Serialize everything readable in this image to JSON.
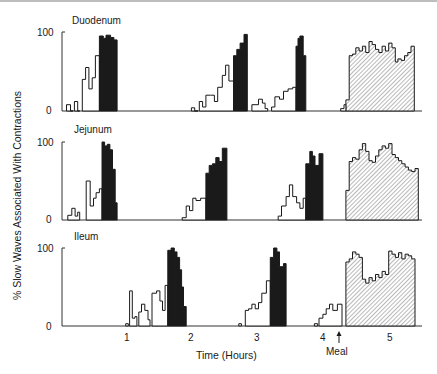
{
  "chart_data": {
    "type": "bar",
    "subtype": "stepped-histogram, three stacked panels",
    "title": "",
    "ylabel": "% Slow Waves Associated With Contractions",
    "xlabel": "Time (Hours)",
    "x_ticks": [
      1,
      2,
      3,
      4,
      5
    ],
    "y_ticks": [
      0,
      100
    ],
    "ylim": [
      0,
      100
    ],
    "xlim": [
      -0.1,
      5.5
    ],
    "annotations": [
      {
        "text": "Meal",
        "x": 4.3,
        "arrow": "up"
      }
    ],
    "legend": [
      {
        "style": "open",
        "meaning": "phase II (irregular) activity"
      },
      {
        "style": "solid-black",
        "meaning": "phase III (activity front)"
      },
      {
        "style": "hatched",
        "meaning": "fed pattern after meal"
      }
    ],
    "grid": false,
    "panels": [
      {
        "name": "Duodenum",
        "open": [
          [
            0.08,
            0.14,
            8
          ],
          [
            0.14,
            0.18,
            0
          ],
          [
            0.2,
            0.25,
            12
          ],
          [
            0.25,
            0.28,
            0
          ],
          [
            0.32,
            0.37,
            40
          ],
          [
            0.37,
            0.42,
            55
          ],
          [
            0.42,
            0.47,
            28
          ],
          [
            0.47,
            0.52,
            42
          ],
          [
            0.52,
            0.58,
            70
          ],
          [
            1.98,
            2.03,
            4
          ],
          [
            2.03,
            2.08,
            0
          ],
          [
            2.1,
            2.15,
            12
          ],
          [
            2.15,
            2.2,
            5
          ],
          [
            2.2,
            2.27,
            20
          ],
          [
            2.27,
            2.33,
            20
          ],
          [
            2.33,
            2.38,
            12
          ],
          [
            2.38,
            2.45,
            30
          ],
          [
            2.45,
            2.5,
            45
          ],
          [
            2.5,
            2.55,
            58
          ],
          [
            2.55,
            2.62,
            38
          ],
          [
            2.9,
            3.0,
            8
          ],
          [
            3.0,
            3.06,
            15
          ],
          [
            3.06,
            3.1,
            10
          ],
          [
            3.1,
            3.14,
            3
          ],
          [
            3.2,
            3.25,
            5
          ],
          [
            3.25,
            3.32,
            18
          ],
          [
            3.32,
            3.38,
            15
          ],
          [
            3.38,
            3.45,
            25
          ],
          [
            3.45,
            3.52,
            28
          ],
          [
            3.52,
            3.57,
            30
          ],
          [
            4.25,
            4.3,
            3
          ],
          [
            4.3,
            4.33,
            8
          ]
        ],
        "phase3": [
          [
            0.58,
            0.64,
            95
          ],
          [
            0.64,
            0.68,
            92
          ],
          [
            0.68,
            0.75,
            96
          ],
          [
            0.75,
            0.8,
            93
          ],
          [
            0.8,
            0.85,
            90
          ],
          [
            2.62,
            2.67,
            70
          ],
          [
            2.67,
            2.72,
            78
          ],
          [
            2.72,
            2.78,
            86
          ],
          [
            2.78,
            2.83,
            97
          ],
          [
            3.57,
            3.6,
            82
          ],
          [
            3.6,
            3.63,
            92
          ],
          [
            3.63,
            3.68,
            95
          ],
          [
            3.68,
            3.72,
            70
          ]
        ],
        "fed": [
          [
            4.33,
            4.38,
            14
          ],
          [
            4.38,
            4.43,
            70
          ],
          [
            4.43,
            4.48,
            72
          ],
          [
            4.48,
            4.53,
            80
          ],
          [
            4.53,
            4.58,
            76
          ],
          [
            4.58,
            4.63,
            82
          ],
          [
            4.63,
            4.68,
            74
          ],
          [
            4.68,
            4.73,
            88
          ],
          [
            4.73,
            4.78,
            84
          ],
          [
            4.78,
            4.83,
            78
          ],
          [
            4.83,
            4.88,
            74
          ],
          [
            4.88,
            4.93,
            82
          ],
          [
            4.93,
            4.98,
            76
          ],
          [
            4.98,
            5.03,
            86
          ],
          [
            5.03,
            5.08,
            80
          ],
          [
            5.08,
            5.12,
            62
          ],
          [
            5.12,
            5.17,
            66
          ],
          [
            5.17,
            5.22,
            64
          ],
          [
            5.22,
            5.27,
            70
          ],
          [
            5.27,
            5.32,
            74
          ],
          [
            5.32,
            5.37,
            82
          ]
        ]
      },
      {
        "name": "Jejunum",
        "open": [
          [
            0.1,
            0.16,
            6
          ],
          [
            0.16,
            0.21,
            15
          ],
          [
            0.21,
            0.25,
            5
          ],
          [
            0.25,
            0.28,
            10
          ],
          [
            0.38,
            0.44,
            50
          ],
          [
            0.44,
            0.49,
            18
          ],
          [
            0.49,
            0.53,
            28
          ],
          [
            0.53,
            0.58,
            35
          ],
          [
            0.58,
            0.62,
            40
          ],
          [
            1.84,
            1.9,
            3
          ],
          [
            1.9,
            1.95,
            18
          ],
          [
            1.95,
            2.0,
            12
          ],
          [
            2.0,
            2.05,
            28
          ],
          [
            2.05,
            2.12,
            25
          ],
          [
            2.12,
            2.2,
            28
          ],
          [
            3.3,
            3.35,
            5
          ],
          [
            3.35,
            3.42,
            18
          ],
          [
            3.42,
            3.47,
            30
          ],
          [
            3.47,
            3.52,
            45
          ],
          [
            3.52,
            3.58,
            30
          ],
          [
            3.58,
            3.63,
            22
          ],
          [
            3.63,
            3.68,
            15
          ],
          [
            3.68,
            3.72,
            28
          ]
        ],
        "phase3": [
          [
            0.62,
            0.66,
            100
          ],
          [
            0.66,
            0.7,
            95
          ],
          [
            0.7,
            0.74,
            97
          ],
          [
            0.74,
            0.78,
            90
          ],
          [
            0.78,
            0.82,
            65
          ],
          [
            0.82,
            0.85,
            22
          ],
          [
            2.2,
            2.25,
            60
          ],
          [
            2.25,
            2.3,
            70
          ],
          [
            2.3,
            2.35,
            72
          ],
          [
            2.35,
            2.4,
            80
          ],
          [
            2.4,
            2.45,
            75
          ],
          [
            2.45,
            2.52,
            92
          ],
          [
            3.72,
            3.78,
            72
          ],
          [
            3.78,
            3.82,
            88
          ],
          [
            3.82,
            3.86,
            82
          ],
          [
            3.86,
            3.92,
            70
          ],
          [
            3.92,
            3.98,
            85
          ]
        ],
        "fed": [
          [
            4.33,
            4.38,
            38
          ],
          [
            4.38,
            4.43,
            75
          ],
          [
            4.43,
            4.48,
            80
          ],
          [
            4.48,
            4.53,
            78
          ],
          [
            4.53,
            4.58,
            90
          ],
          [
            4.58,
            4.63,
            98
          ],
          [
            4.63,
            4.68,
            88
          ],
          [
            4.68,
            4.73,
            76
          ],
          [
            4.73,
            4.78,
            74
          ],
          [
            4.78,
            4.83,
            82
          ],
          [
            4.83,
            4.88,
            90
          ],
          [
            4.88,
            4.93,
            95
          ],
          [
            4.93,
            4.98,
            92
          ],
          [
            4.98,
            5.03,
            98
          ],
          [
            5.03,
            5.08,
            84
          ],
          [
            5.08,
            5.13,
            80
          ],
          [
            5.13,
            5.18,
            76
          ],
          [
            5.18,
            5.23,
            72
          ],
          [
            5.23,
            5.28,
            68
          ],
          [
            5.28,
            5.33,
            64
          ],
          [
            5.33,
            5.38,
            62
          ],
          [
            5.38,
            5.43,
            66
          ]
        ]
      },
      {
        "name": "Ileum",
        "open": [
          [
            0.98,
            1.02,
            3
          ],
          [
            1.04,
            1.08,
            45
          ],
          [
            1.08,
            1.12,
            10
          ],
          [
            1.12,
            1.15,
            12
          ],
          [
            1.18,
            1.22,
            18
          ],
          [
            1.22,
            1.27,
            28
          ],
          [
            1.27,
            1.32,
            20
          ],
          [
            1.32,
            1.35,
            8
          ],
          [
            1.38,
            1.45,
            42
          ],
          [
            1.45,
            1.5,
            45
          ],
          [
            1.5,
            1.54,
            32
          ],
          [
            1.54,
            1.58,
            20
          ],
          [
            1.58,
            1.62,
            52
          ],
          [
            2.7,
            2.74,
            3
          ],
          [
            2.8,
            2.85,
            20
          ],
          [
            2.85,
            2.9,
            22
          ],
          [
            2.9,
            2.95,
            28
          ],
          [
            2.95,
            3.0,
            22
          ],
          [
            3.0,
            3.05,
            30
          ],
          [
            3.05,
            3.12,
            42
          ],
          [
            3.12,
            3.18,
            58
          ],
          [
            3.85,
            3.9,
            3
          ],
          [
            3.92,
            3.98,
            10
          ],
          [
            3.98,
            4.03,
            15
          ],
          [
            4.03,
            4.08,
            22
          ],
          [
            4.08,
            4.13,
            28
          ],
          [
            4.13,
            4.2,
            20
          ],
          [
            4.2,
            4.27,
            28
          ]
        ],
        "phase3": [
          [
            1.62,
            1.67,
            97
          ],
          [
            1.67,
            1.72,
            100
          ],
          [
            1.72,
            1.76,
            95
          ],
          [
            1.76,
            1.8,
            88
          ],
          [
            1.8,
            1.83,
            72
          ],
          [
            1.83,
            1.86,
            50
          ],
          [
            1.86,
            1.9,
            25
          ],
          [
            3.18,
            3.23,
            88
          ],
          [
            3.23,
            3.28,
            100
          ],
          [
            3.28,
            3.32,
            95
          ],
          [
            3.32,
            3.38,
            76
          ],
          [
            3.38,
            3.42,
            80
          ]
        ],
        "fed": [
          [
            4.33,
            4.38,
            82
          ],
          [
            4.38,
            4.43,
            86
          ],
          [
            4.43,
            4.48,
            95
          ],
          [
            4.48,
            4.53,
            92
          ],
          [
            4.53,
            4.58,
            88
          ],
          [
            4.58,
            4.63,
            60
          ],
          [
            4.63,
            4.68,
            55
          ],
          [
            4.68,
            4.73,
            62
          ],
          [
            4.73,
            4.78,
            58
          ],
          [
            4.78,
            4.83,
            66
          ],
          [
            4.83,
            4.88,
            62
          ],
          [
            4.88,
            4.93,
            70
          ],
          [
            4.93,
            4.98,
            66
          ],
          [
            4.98,
            5.03,
            96
          ],
          [
            5.03,
            5.08,
            92
          ],
          [
            5.08,
            5.13,
            88
          ],
          [
            5.13,
            5.18,
            94
          ],
          [
            5.18,
            5.23,
            86
          ],
          [
            5.23,
            5.28,
            92
          ],
          [
            5.28,
            5.33,
            90
          ],
          [
            5.33,
            5.38,
            86
          ]
        ]
      }
    ]
  },
  "labels": {
    "panels": [
      "Duodenum",
      "Jejunum",
      "Ileum"
    ],
    "y_axis_title": "% Slow Waves Associated With Contractions",
    "x_axis_title": "Time (Hours)",
    "x_ticks": [
      "1",
      "2",
      "3",
      "4",
      "5"
    ],
    "y_tick_top": "100",
    "y_tick_bottom": "0",
    "meal_label": "Meal"
  },
  "colors": {
    "ink": "#1a1a1a",
    "hatch": "#9a9a9a",
    "axis": "#333333"
  }
}
